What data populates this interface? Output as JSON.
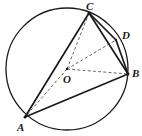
{
  "figure": {
    "kind": "circle-geometry-diagram",
    "canvas": {
      "width": 142,
      "height": 136
    },
    "colors": {
      "background": "#ffffff",
      "stroke": "#1a1a1a",
      "dashed_stroke": "#555555",
      "label": "#1a1a1a"
    },
    "circle": {
      "name": "circumscribed-circle",
      "center_label": "O",
      "cx": 67,
      "cy": 69,
      "r": 61,
      "stroke_width": 1.3
    },
    "points": [
      {
        "id": "C",
        "label": "C",
        "x": 89,
        "y": 13,
        "label_x": 86,
        "label_y": 1,
        "on_circle": true
      },
      {
        "id": "D",
        "label": "D",
        "x": 116,
        "y": 40,
        "label_x": 122,
        "label_y": 30,
        "on_circle": true
      },
      {
        "id": "B",
        "label": "B",
        "x": 128,
        "y": 74,
        "label_x": 132,
        "label_y": 68,
        "on_circle": true
      },
      {
        "id": "A",
        "label": "A",
        "x": 25,
        "y": 117,
        "label_x": 17,
        "label_y": 122,
        "on_circle": true
      },
      {
        "id": "O",
        "label": "O",
        "x": 67,
        "y": 69,
        "label_x": 63,
        "label_y": 74,
        "on_circle": false
      }
    ],
    "solid_segments": [
      {
        "name": "chord-A-C",
        "from": "A",
        "to": "C"
      },
      {
        "name": "chord-C-B",
        "from": "C",
        "to": "B"
      },
      {
        "name": "chord-A-B",
        "from": "A",
        "to": "B"
      },
      {
        "name": "segment-C-D",
        "from": "C",
        "to": "D"
      },
      {
        "name": "segment-D-B",
        "from": "D",
        "to": "B"
      }
    ],
    "dashed_segments": [
      {
        "name": "radius-O-A",
        "from": "O",
        "to": "A"
      },
      {
        "name": "radius-O-C",
        "from": "O",
        "to": "C"
      },
      {
        "name": "radius-O-B",
        "from": "O",
        "to": "B"
      },
      {
        "name": "radius-O-D",
        "from": "O",
        "to": "D"
      }
    ]
  }
}
